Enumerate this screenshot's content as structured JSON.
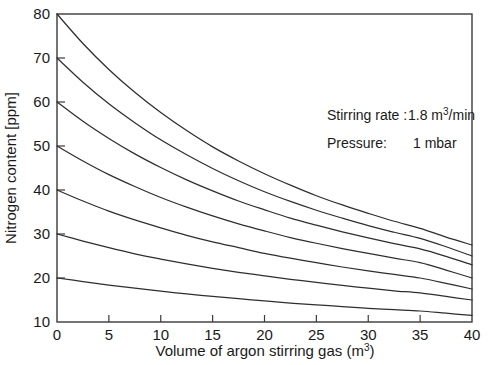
{
  "chart_data": {
    "type": "line",
    "title": "",
    "xlabel": "Volume of argon stirring gas (m3)",
    "xlabel_base": "Volume of argon stirring gas (m",
    "xlabel_sup": "3",
    "xlabel_tail": ")",
    "ylabel": "Nitrogen content [ppm]",
    "xlim": [
      0,
      40
    ],
    "ylim": [
      10,
      80
    ],
    "xticks": [
      0,
      5,
      10,
      15,
      20,
      25,
      30,
      35,
      40
    ],
    "xticklabels": [
      "0",
      "5",
      "10",
      "15",
      "20",
      "25",
      "30",
      "35",
      "40"
    ],
    "yticks": [
      10,
      20,
      30,
      40,
      50,
      60,
      70,
      80
    ],
    "yticklabels": [
      "10",
      "20",
      "30",
      "40",
      "50",
      "60",
      "70",
      "80"
    ],
    "grid": false,
    "legend": "none",
    "x": [
      0,
      2.5,
      5,
      7.5,
      10,
      12.5,
      15,
      17.5,
      20,
      22.5,
      25,
      27.5,
      30,
      32.5,
      35,
      37.5,
      40
    ],
    "series": [
      {
        "name": "initial-80ppm",
        "start_value": 80,
        "end_value": 27.5,
        "values": [
          80.0,
          73.3,
          67.4,
          62.2,
          57.6,
          53.5,
          49.8,
          46.6,
          43.7,
          41.1,
          38.7,
          36.6,
          34.7,
          32.9,
          31.3,
          29.3,
          27.5
        ]
      },
      {
        "name": "initial-70ppm",
        "start_value": 70,
        "end_value": 25.0,
        "values": [
          70.0,
          64.5,
          59.6,
          55.3,
          51.4,
          48.0,
          44.9,
          42.1,
          39.6,
          37.4,
          35.4,
          33.6,
          31.9,
          30.4,
          29.0,
          27.1,
          25.0
        ]
      },
      {
        "name": "initial-60ppm",
        "start_value": 60,
        "end_value": 23.0,
        "values": [
          60.0,
          55.6,
          51.7,
          48.2,
          45.1,
          42.3,
          39.8,
          37.5,
          35.5,
          33.6,
          32.0,
          30.5,
          29.1,
          27.8,
          26.6,
          24.9,
          23.0
        ]
      },
      {
        "name": "initial-50ppm",
        "start_value": 50,
        "end_value": 20.0,
        "values": [
          50.0,
          46.6,
          43.5,
          40.8,
          38.3,
          36.1,
          34.1,
          32.3,
          30.7,
          29.2,
          27.9,
          26.7,
          25.6,
          24.5,
          23.5,
          21.8,
          20.0
        ]
      },
      {
        "name": "initial-40ppm",
        "start_value": 40,
        "end_value": 17.5,
        "values": [
          40.0,
          37.5,
          35.2,
          33.2,
          31.4,
          29.7,
          28.2,
          26.9,
          25.6,
          24.5,
          23.5,
          22.5,
          21.6,
          20.8,
          20.0,
          18.8,
          17.5
        ]
      },
      {
        "name": "initial-30ppm",
        "start_value": 30,
        "end_value": 15.0,
        "values": [
          30.0,
          28.4,
          26.9,
          25.5,
          24.3,
          23.2,
          22.2,
          21.3,
          20.5,
          19.7,
          19.0,
          18.3,
          17.7,
          17.1,
          16.6,
          15.8,
          15.0
        ]
      },
      {
        "name": "initial-20ppm",
        "start_value": 20,
        "end_value": 11.5,
        "values": [
          20.0,
          19.2,
          18.4,
          17.7,
          17.0,
          16.4,
          15.8,
          15.3,
          14.8,
          14.3,
          13.9,
          13.5,
          13.1,
          12.8,
          12.5,
          12.0,
          11.5
        ]
      }
    ],
    "annotations": [
      {
        "label": "Stirring rate :",
        "value_base": "1.8 m",
        "value_sup": "3",
        "value_tail": "/min"
      },
      {
        "label": "Pressure:",
        "value_base": "1 mbar",
        "value_sup": "",
        "value_tail": ""
      }
    ]
  },
  "colors": {
    "background": "#ffffff",
    "axis": "#3a3a3a",
    "curve": "#2e2e2e",
    "text": "#1a1a1a"
  }
}
